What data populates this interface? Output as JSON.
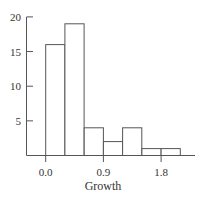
{
  "chart_data": {
    "type": "bar",
    "subtype": "histogram",
    "title": "",
    "xlabel": "Growth",
    "ylabel": "",
    "bin_edges": [
      0.0,
      0.3,
      0.6,
      0.9,
      1.2,
      1.5,
      1.8,
      2.1
    ],
    "categories": [
      "0.0-0.3",
      "0.3-0.6",
      "0.6-0.9",
      "0.9-1.2",
      "1.2-1.5",
      "1.5-1.8",
      "1.8-2.1"
    ],
    "values": [
      16,
      19,
      4,
      2,
      4,
      1,
      1
    ],
    "x_ticks": [
      0.0,
      0.9,
      1.8
    ],
    "x_tick_labels": [
      "0.0",
      "0.9",
      "1.8"
    ],
    "y_ticks": [
      5,
      10,
      15,
      20
    ],
    "y_tick_labels": [
      "5",
      "10",
      "15",
      "20"
    ],
    "xlim": [
      -0.3,
      2.4
    ],
    "ylim": [
      0,
      20
    ],
    "grid": false,
    "legend": null,
    "colors": {
      "bar_fill": "#ffffff",
      "bar_edge": "#555555",
      "axis": "#555555",
      "text": "#333333"
    }
  }
}
